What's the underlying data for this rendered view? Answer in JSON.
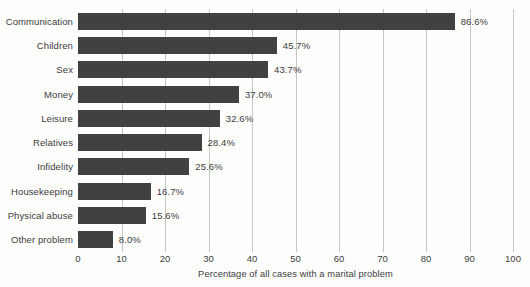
{
  "chart_data": {
    "type": "bar",
    "orientation": "horizontal",
    "categories": [
      "Communication",
      "Children",
      "Sex",
      "Money",
      "Leisure",
      "Relatives",
      "Infidelity",
      "Housekeeping",
      "Physical abuse",
      "Other problem"
    ],
    "values": [
      86.6,
      45.7,
      43.7,
      37.0,
      32.6,
      28.4,
      25.6,
      16.7,
      15.6,
      8.0
    ],
    "value_labels": [
      "86.6%",
      "45.7%",
      "43.7%",
      "37.0%",
      "32.6%",
      "28.4%",
      "25.6%",
      "16.7%",
      "15.6%",
      "8.0%"
    ],
    "title": "",
    "xlabel": "Percentage of all cases with a marital problem",
    "ylabel": "",
    "xlim": [
      0,
      100
    ],
    "xticks": [
      0,
      10,
      20,
      30,
      40,
      50,
      60,
      70,
      80,
      90,
      100
    ],
    "grid": "vertical",
    "legend": "none",
    "bar_color": "#414141",
    "gridline_color": "#c6c6c4",
    "text_color": "#3c3c3c"
  }
}
